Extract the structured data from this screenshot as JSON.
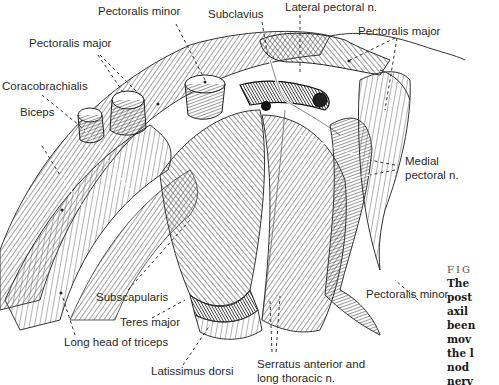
{
  "figure": {
    "type": "anatomical-illustration",
    "labels": {
      "pectoralis_minor_top": "Pectoralis minor",
      "subclavius": "Subclavius",
      "lateral_pectoral_n": "Lateral pectoral n.",
      "pectoralis_major_left": "Pectoralis major",
      "pectoralis_major_right": "Pectoralis major",
      "coracobrachialis": "Coracobrachialis",
      "biceps": "Biceps",
      "medial_pectoral_n_line1": "Medial",
      "medial_pectoral_n_line2": "pectoral n.",
      "pectoralis_minor_bottom": "Pectoralis minor",
      "subscapularis": "Subscapularis",
      "teres_major": "Teres major",
      "long_head_of_triceps": "Long head of triceps",
      "latissimus_dorsi": "Latissimus dorsi",
      "serratus_line1": "Serratus anterior and",
      "serratus_line2": "long thoracic n."
    },
    "caption": {
      "heading": "FIG",
      "lines": [
        "The",
        "post",
        "axil",
        "been",
        "mov",
        "the l",
        "nod",
        "nerv"
      ]
    }
  }
}
